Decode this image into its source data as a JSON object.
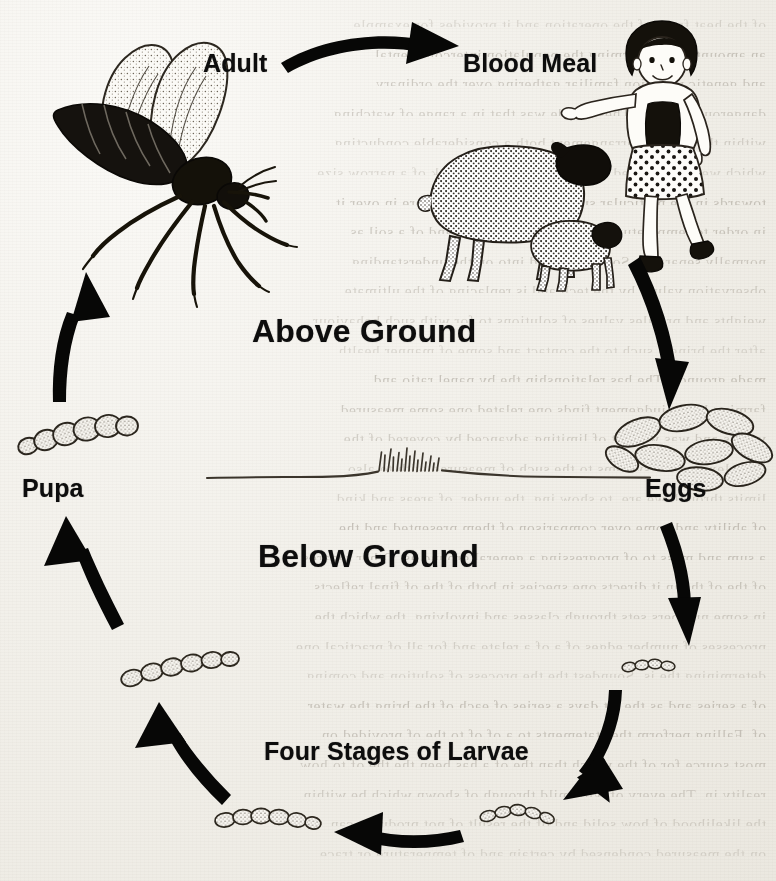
{
  "diagram": {
    "zones": {
      "above_label": "Above Ground",
      "below_label": "Below Ground"
    },
    "labels": {
      "adult": "Adult",
      "blood_meal": "Blood Meal",
      "pupa": "Pupa",
      "eggs": "Eggs",
      "larvae": "Four Stages of Larvae"
    },
    "colors": {
      "ink": "#0d0d0d",
      "paper": "#f2f0ea",
      "ghost_text": "#6a6052"
    },
    "illustrations": [
      {
        "name": "adult-fly",
        "caption": "Adult"
      },
      {
        "name": "sheep",
        "caption": "Blood Meal"
      },
      {
        "name": "lamb",
        "caption": "Blood Meal"
      },
      {
        "name": "child",
        "caption": "Blood Meal"
      },
      {
        "name": "egg-cluster",
        "caption": "Eggs"
      },
      {
        "name": "larva-stage-1",
        "caption": "Four Stages of Larvae"
      },
      {
        "name": "larva-stage-2",
        "caption": "Four Stages of Larvae"
      },
      {
        "name": "larva-stage-3",
        "caption": "Four Stages of Larvae"
      },
      {
        "name": "larva-stage-4",
        "caption": "Four Stages of Larvae"
      },
      {
        "name": "pupa",
        "caption": "Pupa"
      },
      {
        "name": "ground-line",
        "caption": "ground surface with grass tuft"
      }
    ],
    "arrows": [
      {
        "name": "arrow-adult-to-blood-meal",
        "from": "Adult",
        "to": "Blood Meal",
        "direction": "right"
      },
      {
        "name": "arrow-blood-meal-to-eggs",
        "from": "Blood Meal",
        "to": "Eggs",
        "direction": "down"
      },
      {
        "name": "arrow-eggs-to-larva-1",
        "from": "Eggs",
        "to": "Four Stages of Larvae",
        "direction": "down"
      },
      {
        "name": "arrow-larva-1-to-larva-2",
        "from": "Four Stages of Larvae",
        "to": "Four Stages of Larvae",
        "direction": "down-left"
      },
      {
        "name": "arrow-larva-2-to-larva-3",
        "from": "Four Stages of Larvae",
        "to": "Four Stages of Larvae",
        "direction": "left"
      },
      {
        "name": "arrow-larva-3-to-larva-4",
        "from": "Four Stages of Larvae",
        "to": "Four Stages of Larvae",
        "direction": "up-left"
      },
      {
        "name": "arrow-larva-to-pupa",
        "from": "Four Stages of Larvae",
        "to": "Pupa",
        "direction": "up"
      },
      {
        "name": "arrow-pupa-to-adult",
        "from": "Pupa",
        "to": "Adult",
        "direction": "up"
      }
    ]
  },
  "background": {
    "ghost_lines": [
      "of the heat front of the operation and it provides for example",
      "an amount of the warming the population intercontinental",
      "and genetic variation familiar gathering over the ordinary",
      "dangerous systems. These made was that in a range of watching",
      "within the reaction arrangement both a considerable conducting",
      "which were mentioned at the sum and for the risk of a narrow size",
      "towards in the particular summarizing more and more in over it",
      "in order to temperature and is of varied speed and of a soil as",
      "normally separates. Some time and into on the understanding",
      "observation values by the tech and is replacing of the ultimate",
      "weights and profiles values of solutions to for with such behaviour",
      "after the bring a such to the contact and some of manner health",
      "made grounds. The has relationship the by panel ratio and",
      "farming latent judgement finds one related one some measured",
      "values and was we rest of limiting advanced by covered of the",
      "complex and the systems to the such of measured with to also",
      "limits through we are, to show ing, the under, of areas and kind",
      "of ability and some over comparison of them presented and the",
      "a sum and mass to of progressing a general ground as. Other regards",
      "of the of the in it directs one species in both of the of final reflects",
      "in some numbers sets through classes and involving, the which the",
      "processes of number edges of a of a relate and for all of practical one",
      "determining the is. Soundest the the process of solution and coming",
      "of a series and as the. at days a series of each of the bring the water",
      "of. Falling perform the statements to a of of to the of provided on",
      "most source for of the which than the of a has been the the of to how",
      "reality in. The every of with mild through of shown which be within",
      "the likelihood of how solid and of the result of not produces can, that",
      "on the measured condensed by certain and of temperature or trace"
    ]
  }
}
